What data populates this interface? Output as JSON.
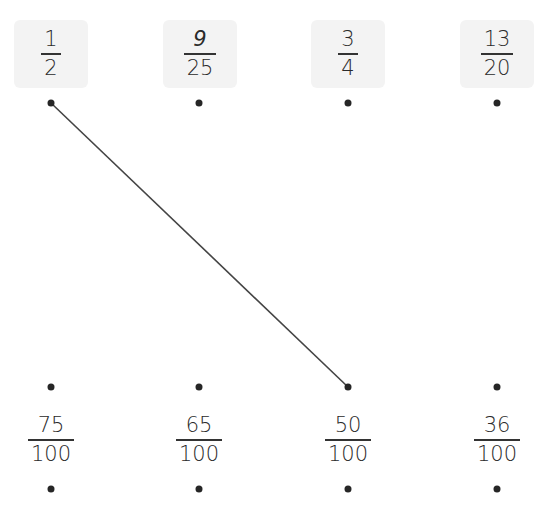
{
  "top_items": [
    {
      "numerator": "1",
      "denominator": "2"
    },
    {
      "numerator": "9",
      "denominator": "25"
    },
    {
      "numerator": "3",
      "denominator": "4"
    },
    {
      "numerator": "13",
      "denominator": "20"
    }
  ],
  "bottom_items": [
    {
      "numerator": "75",
      "denominator": "100"
    },
    {
      "numerator": "65",
      "denominator": "100"
    },
    {
      "numerator": "50",
      "denominator": "100"
    },
    {
      "numerator": "36",
      "denominator": "100"
    }
  ],
  "connections": [
    {
      "from": "top-1",
      "to": "bottom-3",
      "from_label": "1/2",
      "to_label": "50/100"
    }
  ],
  "colors": {
    "card_bg": "#f3f3f3",
    "line": "#444444",
    "dot": "#262626"
  }
}
